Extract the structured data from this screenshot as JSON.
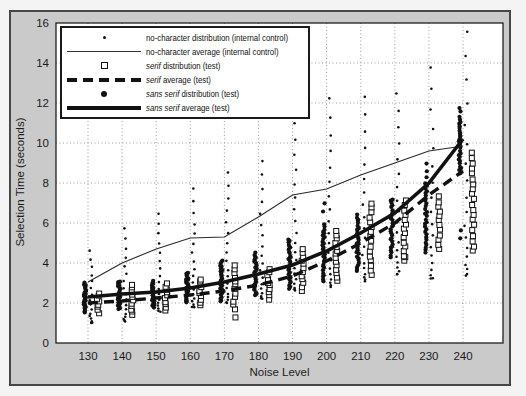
{
  "colors": {
    "outer_bg": "#f4f4f4",
    "figure_bg": "#cacaca",
    "frame_border": "#474747",
    "plot_bg": "#ffffff",
    "ink": "#111111",
    "grid": "#9b9b9b"
  },
  "legend": {
    "items": [
      {
        "symbol": "small-dot",
        "em": "",
        "label": "no-character distribution (internal control)"
      },
      {
        "symbol": "thin-line",
        "em": "",
        "label": "no-character average (internal control)"
      },
      {
        "symbol": "open-square",
        "em": "serif",
        "label": " distribution (test)"
      },
      {
        "symbol": "thick-dash",
        "em": "serif",
        "label": " average (test)"
      },
      {
        "symbol": "filled-circle",
        "em": "sans serif",
        "label": " distribution (test)"
      },
      {
        "symbol": "thick-line",
        "em": "sans serif",
        "label": " average (test)"
      }
    ]
  },
  "chart_data": {
    "type": "scatter",
    "title": "",
    "xlabel": "Noise Level",
    "ylabel": "Selection Time (seconds)",
    "x": [
      130,
      140,
      150,
      160,
      170,
      180,
      190,
      200,
      210,
      220,
      230,
      240
    ],
    "x_ticks": [
      130,
      140,
      150,
      160,
      170,
      180,
      190,
      200,
      210,
      220,
      230,
      240
    ],
    "y_ticks": [
      0,
      2,
      4,
      6,
      8,
      10,
      12,
      14,
      16
    ],
    "ylim": [
      0,
      16
    ],
    "grid": true,
    "legend_position": "top-left",
    "series": [
      {
        "name": "no-character average (internal control)",
        "type": "line",
        "style": "thin-solid",
        "values": [
          3.05,
          4.0,
          4.7,
          5.25,
          5.3,
          6.3,
          7.4,
          7.7,
          8.4,
          9.0,
          9.6,
          9.85
        ]
      },
      {
        "name": "serif average (test)",
        "type": "line",
        "style": "thick-dashed",
        "values": [
          2.0,
          2.1,
          2.25,
          2.4,
          2.6,
          2.9,
          3.35,
          4.1,
          5.0,
          6.0,
          7.4,
          8.6
        ]
      },
      {
        "name": "sans serif average (test)",
        "type": "line",
        "style": "thick-solid",
        "values": [
          2.3,
          2.45,
          2.55,
          2.75,
          3.05,
          3.45,
          3.9,
          4.6,
          5.5,
          6.5,
          8.0,
          10.2
        ]
      },
      {
        "name": "no-character distribution (internal control)",
        "type": "scatter",
        "marker": "small-dot",
        "x_offset": 3,
        "bias": 1.8,
        "distributions": [
          {
            "min": 1.0,
            "max": 4.6,
            "n": 16
          },
          {
            "min": 1.1,
            "max": 5.7,
            "n": 17
          },
          {
            "min": 1.6,
            "max": 6.5,
            "n": 17
          },
          {
            "min": 1.8,
            "max": 7.7,
            "n": 18
          },
          {
            "min": 2.0,
            "max": 8.5,
            "n": 18
          },
          {
            "min": 2.2,
            "max": 9.1,
            "n": 18
          },
          {
            "min": 2.6,
            "max": 11.0,
            "n": 19
          },
          {
            "min": 2.8,
            "max": 12.2,
            "n": 19
          },
          {
            "min": 3.1,
            "max": 12.3,
            "n": 19
          },
          {
            "min": 3.4,
            "max": 12.5,
            "n": 19
          },
          {
            "min": 3.2,
            "max": 13.8,
            "n": 18
          },
          {
            "min": 3.4,
            "max": 15.6,
            "n": 18
          }
        ]
      },
      {
        "name": "serif distribution (test)",
        "type": "scatter",
        "marker": "open-square",
        "x_offset": 10,
        "bias": 1.0,
        "distributions": [
          {
            "min": 1.5,
            "max": 2.5,
            "n": 8
          },
          {
            "min": 1.4,
            "max": 2.9,
            "n": 11
          },
          {
            "min": 1.6,
            "max": 3.0,
            "n": 10
          },
          {
            "min": 1.9,
            "max": 3.2,
            "n": 10
          },
          {
            "min": 1.7,
            "max": 3.9,
            "n": 12,
            "outliers": [
              1.3
            ]
          },
          {
            "min": 2.2,
            "max": 3.7,
            "n": 10
          },
          {
            "min": 2.6,
            "max": 4.7,
            "n": 12
          },
          {
            "min": 3.1,
            "max": 5.6,
            "n": 14
          },
          {
            "min": 3.4,
            "max": 7.0,
            "n": 16
          },
          {
            "min": 4.1,
            "max": 7.1,
            "n": 14,
            "outliers": [
              4.3
            ]
          },
          {
            "min": 4.7,
            "max": 7.3,
            "n": 12
          },
          {
            "min": 4.6,
            "max": 9.5,
            "n": 20
          }
        ]
      },
      {
        "name": "sans serif distribution (test)",
        "type": "scatter",
        "marker": "filled-circle",
        "x_offset": -3,
        "bias": 1.0,
        "distributions": [
          {
            "min": 1.55,
            "max": 3.0,
            "n": 26
          },
          {
            "min": 1.7,
            "max": 3.1,
            "n": 26
          },
          {
            "min": 1.8,
            "max": 3.1,
            "n": 26
          },
          {
            "min": 2.0,
            "max": 3.5,
            "n": 26
          },
          {
            "min": 2.1,
            "max": 4.1,
            "n": 28
          },
          {
            "min": 2.4,
            "max": 4.5,
            "n": 28
          },
          {
            "min": 2.7,
            "max": 5.2,
            "n": 28
          },
          {
            "min": 3.1,
            "max": 5.9,
            "n": 28,
            "outliers": [
              6.6,
              7.0
            ]
          },
          {
            "min": 3.6,
            "max": 6.4,
            "n": 28
          },
          {
            "min": 4.3,
            "max": 7.2,
            "n": 28
          },
          {
            "min": 4.5,
            "max": 8.0,
            "n": 28,
            "outliers": [
              8.3,
              8.6,
              9.0
            ]
          },
          {
            "min": 8.5,
            "max": 11.3,
            "n": 26,
            "outliers": [
              11.6,
              11.75,
              5.2,
              5.6
            ]
          }
        ]
      }
    ]
  }
}
